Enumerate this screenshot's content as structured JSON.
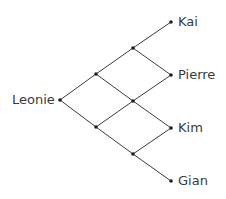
{
  "diagram": {
    "type": "lattice-path-diagram",
    "root": {
      "label": "Leonie",
      "x": 60,
      "y": 100
    },
    "leaves": [
      {
        "label": "Kai",
        "x": 171,
        "y": 22
      },
      {
        "label": "Pierre",
        "x": 171,
        "y": 75
      },
      {
        "label": "Kim",
        "x": 171,
        "y": 128
      },
      {
        "label": "Gian",
        "x": 171,
        "y": 181
      }
    ],
    "inner_nodes": [
      {
        "id": "a1",
        "x": 96,
        "y": 74
      },
      {
        "id": "a2",
        "x": 96,
        "y": 127
      },
      {
        "id": "b1",
        "x": 133,
        "y": 48
      },
      {
        "id": "b2",
        "x": 133,
        "y": 101
      },
      {
        "id": "b3",
        "x": 133,
        "y": 154
      }
    ],
    "edges": [
      [
        "root",
        "a1"
      ],
      [
        "root",
        "a2"
      ],
      [
        "a1",
        "b1"
      ],
      [
        "a1",
        "b2"
      ],
      [
        "a2",
        "b2"
      ],
      [
        "a2",
        "b3"
      ],
      [
        "b1",
        "Kai"
      ],
      [
        "b1",
        "Pierre"
      ],
      [
        "b2",
        "Pierre"
      ],
      [
        "b2",
        "Kim"
      ],
      [
        "b3",
        "Kim"
      ],
      [
        "b3",
        "Gian"
      ]
    ],
    "colors": {
      "line": "#3c3c3c",
      "dot": "#1e1e1e",
      "text": "#3a3a3a"
    }
  }
}
